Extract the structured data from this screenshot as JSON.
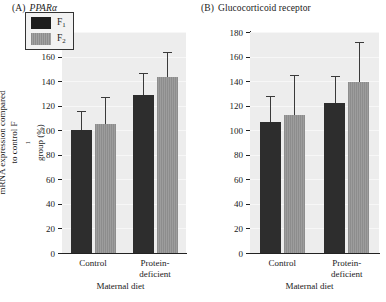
{
  "chart_data": [
    {
      "type": "bar",
      "panel_tag": "(A)",
      "title": "PPARα",
      "title_italic": true,
      "categories": [
        "Control",
        "Protein-deficient"
      ],
      "category_lines": [
        [
          "Control"
        ],
        [
          "Protein-",
          "deficient"
        ]
      ],
      "series": [
        {
          "name": "F1",
          "label": "F",
          "sub": "1",
          "color": "#2d2d2d",
          "values": [
            100,
            129
          ],
          "errors": [
            16,
            18
          ]
        },
        {
          "name": "F2",
          "label": "F",
          "sub": "2",
          "color": "#8d8d8d",
          "values": [
            105,
            143
          ],
          "errors": [
            22,
            21
          ]
        }
      ],
      "xlabel": "Maternal diet",
      "ylabel_line1": "mRNA expression compared",
      "ylabel_line2_pre": "to control F",
      "ylabel_line2_sub": "1",
      "ylabel_line2_post": " group (%)",
      "ylim": [
        0,
        180
      ],
      "yticks": [
        0,
        20,
        40,
        60,
        80,
        100,
        120,
        140,
        160,
        180
      ],
      "grid": true,
      "legend_position": "top-left"
    },
    {
      "type": "bar",
      "panel_tag": "(B)",
      "title": "Glucocorticoid receptor",
      "title_italic": false,
      "categories": [
        "Control",
        "Protein-deficient"
      ],
      "category_lines": [
        [
          "Control"
        ],
        [
          "Protein-",
          "deficient"
        ]
      ],
      "series": [
        {
          "name": "F1",
          "label": "F",
          "sub": "1",
          "color": "#2d2d2d",
          "values": [
            107,
            122
          ],
          "errors": [
            21,
            22
          ]
        },
        {
          "name": "F2",
          "label": "F",
          "sub": "2",
          "color": "#8d8d8d",
          "values": [
            112,
            139
          ],
          "errors": [
            33,
            33
          ]
        }
      ],
      "xlabel": "Maternal diet",
      "ylim": [
        0,
        180
      ],
      "yticks": [
        0,
        20,
        40,
        60,
        80,
        100,
        120,
        140,
        160,
        180
      ],
      "grid": true,
      "legend_position": "none"
    }
  ],
  "colors": {
    "f1_bar": "#2d2d2d",
    "f2_bar": "#8d8d8d",
    "plot_background": "#ededed",
    "axis": "#222222",
    "text": "#1a1a1a"
  }
}
